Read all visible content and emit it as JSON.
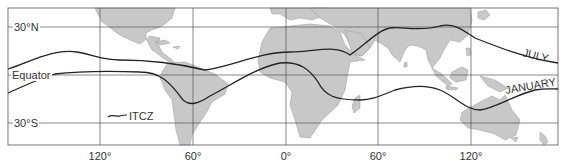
{
  "map": {
    "title": "Seasonal position of the Intertropical Convergence Zone (ITCZ)",
    "latitude_labels": [
      "30°N",
      "Equator",
      "30°S"
    ],
    "longitude_labels": [
      "120°",
      "60°",
      "0°",
      "60°",
      "120°"
    ],
    "legend": {
      "label": "ITCZ"
    },
    "curves": [
      {
        "name": "JULY",
        "label": "JULY"
      },
      {
        "name": "JANUARY",
        "label": "JANUARY"
      }
    ],
    "colors": {
      "land": "#c8c8c8",
      "ocean": "#ffffff",
      "grid": "#555555",
      "line": "#222222"
    }
  }
}
